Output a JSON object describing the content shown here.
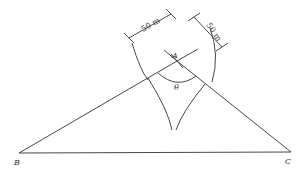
{
  "diagram": {
    "type": "geometry-triangle-arc-construction",
    "vertices": {
      "A": {
        "label": "A",
        "x": 177,
        "y": 61
      },
      "B": {
        "label": "B",
        "x": 19,
        "y": 153
      },
      "C": {
        "label": "C",
        "x": 291,
        "y": 152
      }
    },
    "angle_label": "θ",
    "dimensions": [
      {
        "label": "50 m",
        "along": "AB direction"
      },
      {
        "label": "50 m",
        "along": "AC direction"
      }
    ],
    "colors": {
      "line": "#333333",
      "background": "#ffffff"
    }
  }
}
